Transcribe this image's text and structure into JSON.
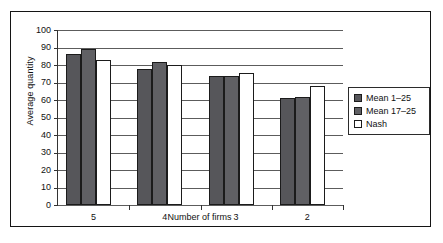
{
  "chart_data": {
    "type": "bar",
    "title": "",
    "subtitle": "",
    "xlabel": "Number of firms",
    "ylabel": "Average quantity",
    "categories": [
      "5",
      "4",
      "3",
      "2"
    ],
    "series": [
      {
        "name": "Mean 1–25",
        "values": [
          86.5,
          78.0,
          74.0,
          61.0
        ],
        "color": "#56565a"
      },
      {
        "name": "Mean 17–25",
        "values": [
          89.0,
          81.5,
          73.5,
          62.0
        ],
        "color": "#606064"
      },
      {
        "name": "Nash",
        "values": [
          83.0,
          80.0,
          75.5,
          68.0
        ],
        "color": "#ffffff"
      }
    ],
    "ylim": [
      0,
      100
    ],
    "ytick_step": 10,
    "yticks": [
      "100",
      "90",
      "80",
      "70",
      "60",
      "50",
      "40",
      "30",
      "20",
      "10",
      "0"
    ],
    "grid": true,
    "grid_axis": "y",
    "legend_position": "right",
    "frame": true
  }
}
